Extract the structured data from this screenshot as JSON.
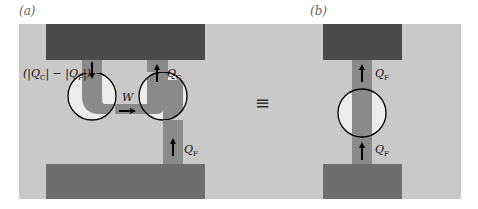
{
  "colors": {
    "background": "#ffffff",
    "panel": "#c9c9c9",
    "hot_reservoir": "#4a4a4a",
    "cold_reservoir": "#6e6e6e",
    "pipe": "#8a8a8a",
    "engine_fill": "#ececec",
    "outline": "#000000",
    "label": "#666666"
  },
  "panel_a": {
    "label": "(a)",
    "top_left_label": {
      "prefix": "(|Q",
      "sub1": "C",
      "middle": "| − |Q",
      "sub2": "F",
      "suffix": "|)"
    },
    "top_right_label": {
      "main": "Q",
      "sub": "C"
    },
    "bottom_right_label": {
      "main": "Q",
      "sub": "F"
    },
    "work_label": "W"
  },
  "equivalence_symbol": "≡",
  "panel_b": {
    "label": "(b)",
    "top_label": {
      "main": "Q",
      "sub": "F"
    },
    "bottom_label": {
      "main": "Q",
      "sub": "F"
    }
  }
}
